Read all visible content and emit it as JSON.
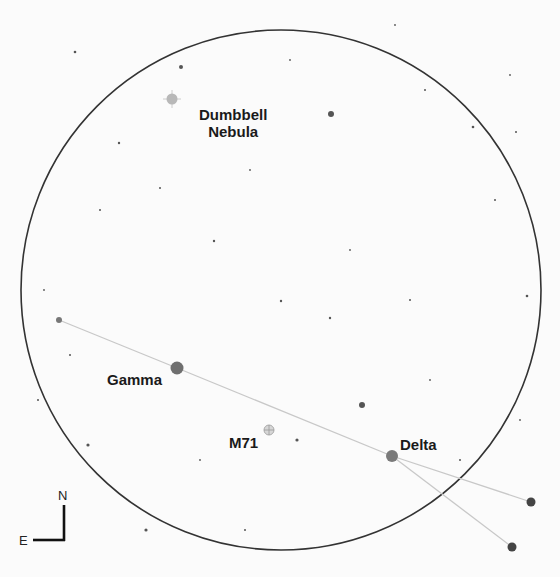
{
  "chart": {
    "field_circle": {
      "cx": 281,
      "cy": 290,
      "r": 260,
      "stroke": "#333333"
    },
    "compass": {
      "north_label": "N",
      "east_label": "E"
    },
    "labels": {
      "dumbbell_line1": "Dumbbell",
      "dumbbell_line2": "Nebula",
      "gamma": "Gamma",
      "m71": "M71",
      "delta": "Delta"
    },
    "objects": [
      {
        "name": "Dumbbell Nebula",
        "type": "deep-sky",
        "x": 172,
        "y": 99
      },
      {
        "name": "M71",
        "type": "deep-sky",
        "x": 269,
        "y": 430
      },
      {
        "name": "Gamma",
        "type": "star",
        "x": 177,
        "y": 368
      },
      {
        "name": "Delta",
        "type": "star",
        "x": 392,
        "y": 456
      }
    ],
    "asterism_lines_color": "#c8c8c8"
  }
}
